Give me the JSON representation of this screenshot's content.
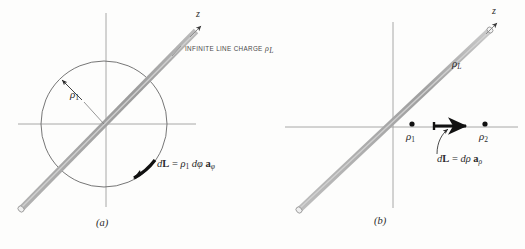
{
  "figure": {
    "background_color": "#fdfdfc",
    "rod_color": "#a8a8a8",
    "axis_color": "#9a9a9a",
    "circle_color": "#6f6f6f",
    "accent_color": "#1a1a1a"
  },
  "panel_a": {
    "caption": "(a)",
    "z_axis_label": "z",
    "line_charge_note": "INFINITE LINE CHARGE",
    "line_charge_symbol_rho": "ρ",
    "line_charge_symbol_sub": "L",
    "radius_label_rho": "ρ",
    "radius_label_sub": "1",
    "dl_equation": {
      "d": "d",
      "L": "L",
      "equals": "=",
      "rho": "ρ",
      "rho_sub": "1",
      "dphi_d": "d",
      "dphi": "φ",
      "a": "a",
      "a_sub": "φ"
    }
  },
  "panel_b": {
    "caption": "(b)",
    "z_axis_label": "z",
    "line_charge_symbol_rho": "ρ",
    "line_charge_symbol_sub": "L",
    "point_1_rho": "ρ",
    "point_1_sub": "1",
    "point_2_rho": "ρ",
    "point_2_sub": "2",
    "dl_equation": {
      "d": "d",
      "L": "L",
      "equals": "=",
      "drho_d": "d",
      "drho": "ρ",
      "a": "a",
      "a_sub": "ρ"
    }
  }
}
